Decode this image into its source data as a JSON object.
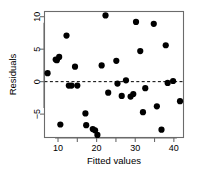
{
  "chart_data": {
    "type": "scatter",
    "title": "",
    "xlabel": "Fitted values",
    "ylabel": "Residuals",
    "xlim": [
      6.5,
      42.5
    ],
    "ylim": [
      -8.6,
      10.8
    ],
    "xticks": [
      10,
      20,
      30,
      40
    ],
    "xminorticks": [
      15,
      25,
      35
    ],
    "yticks": [
      -5,
      0,
      5,
      10
    ],
    "grid": false,
    "legend": null,
    "reference_line": {
      "type": "horizontal",
      "y": 0,
      "style": "dashed"
    },
    "marker": {
      "shape": "circle",
      "color": "#000000",
      "size": 3.1
    },
    "n_points": 35,
    "points": [
      {
        "x": 7.3,
        "y": 1.3
      },
      {
        "x": 9.4,
        "y": 3.4
      },
      {
        "x": 9.7,
        "y": 3.3
      },
      {
        "x": 10.3,
        "y": 3.8
      },
      {
        "x": 10.6,
        "y": -6.6
      },
      {
        "x": 12.2,
        "y": 7.1
      },
      {
        "x": 12.8,
        "y": -0.6
      },
      {
        "x": 13.5,
        "y": -0.6
      },
      {
        "x": 14.4,
        "y": 2.3
      },
      {
        "x": 15.0,
        "y": -0.6
      },
      {
        "x": 17.1,
        "y": -4.9
      },
      {
        "x": 17.3,
        "y": -6.7
      },
      {
        "x": 19.0,
        "y": -7.3
      },
      {
        "x": 19.6,
        "y": -7.5
      },
      {
        "x": 20.2,
        "y": -8.2
      },
      {
        "x": 21.3,
        "y": 2.5
      },
      {
        "x": 22.3,
        "y": 10.2
      },
      {
        "x": 23.0,
        "y": -1.7
      },
      {
        "x": 25.1,
        "y": 3.2
      },
      {
        "x": 25.4,
        "y": -0.3
      },
      {
        "x": 26.5,
        "y": -2.2
      },
      {
        "x": 27.6,
        "y": 0.2
      },
      {
        "x": 28.8,
        "y": -2.3
      },
      {
        "x": 29.5,
        "y": -1.9
      },
      {
        "x": 30.2,
        "y": 9.2
      },
      {
        "x": 31.3,
        "y": 4.7
      },
      {
        "x": 32.0,
        "y": -4.7
      },
      {
        "x": 32.6,
        "y": -1.0
      },
      {
        "x": 34.8,
        "y": 8.9
      },
      {
        "x": 35.6,
        "y": -3.8
      },
      {
        "x": 36.8,
        "y": -7.4
      },
      {
        "x": 37.9,
        "y": 5.6
      },
      {
        "x": 38.4,
        "y": -0.2
      },
      {
        "x": 39.8,
        "y": 0.1
      },
      {
        "x": 41.6,
        "y": -3.0
      }
    ]
  }
}
